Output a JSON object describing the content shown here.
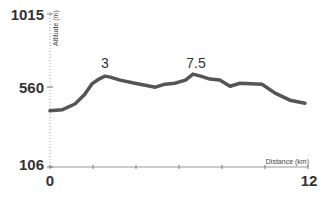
{
  "chart_data": {
    "type": "area",
    "title": "",
    "xlabel": "Distance (km)",
    "ylabel": "Altitude (m)",
    "xlim": [
      0,
      12
    ],
    "ylim": [
      106,
      1015
    ],
    "x_tick_labels": [
      "0",
      "12"
    ],
    "y_tick_labels": [
      "1015",
      "560",
      "106"
    ],
    "grid": false,
    "annotations": [
      {
        "text": "3",
        "x": 2.8
      },
      {
        "text": "7.5",
        "x": 6.8
      }
    ],
    "series": [
      {
        "name": "Elevation profile",
        "x": [
          0,
          0.56,
          1.16,
          1.6,
          1.95,
          2.3,
          2.56,
          2.8,
          3.26,
          3.95,
          4.9,
          5.35,
          5.8,
          6.3,
          6.65,
          7.0,
          7.44,
          7.9,
          8.37,
          8.84,
          9.86,
          10.47,
          11.16,
          11.86
        ],
        "values": [
          440,
          446,
          480,
          535,
          600,
          630,
          646,
          640,
          622,
          604,
          580,
          598,
          604,
          622,
          658,
          646,
          628,
          622,
          586,
          604,
          598,
          545,
          503,
          485
        ]
      }
    ],
    "colors": {
      "line": "#555555",
      "axis": "#888888",
      "text": "#333333"
    }
  }
}
